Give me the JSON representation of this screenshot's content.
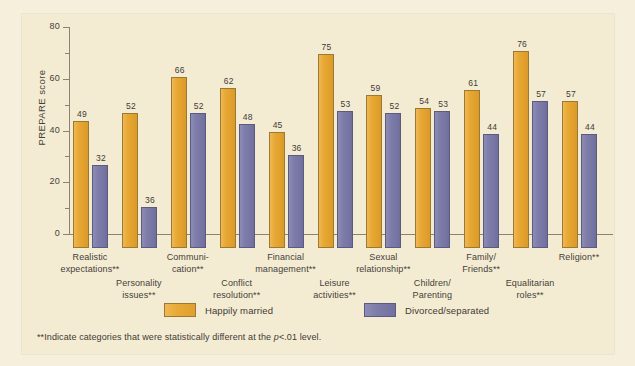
{
  "chart_data": {
    "type": "bar",
    "title": "",
    "xlabel": "",
    "ylabel": "PREPARE score",
    "ylim": [
      0,
      80
    ],
    "yticks": [
      0,
      20,
      40,
      60,
      80
    ],
    "ytick_labels": [
      "0",
      "20",
      "40",
      "60",
      "80"
    ],
    "minor_tick_interval": 10,
    "grid": false,
    "legend_position": "bottom-center",
    "categories": [
      "Realistic expectations**",
      "Personality issues**",
      "Communi- cation**",
      "Conflict resolution**",
      "Financial management**",
      "Leisure activities**",
      "Sexual relationship**",
      "Children/ Parenting",
      "Family/ Friends**",
      "Equalitarian roles**",
      "Religion**"
    ],
    "series": [
      {
        "name": "Happily married",
        "color": "#e8a936",
        "values": [
          49,
          52,
          66,
          62,
          45,
          75,
          59,
          54,
          61,
          76,
          57
        ]
      },
      {
        "name": "Divorced/separated",
        "color": "#7e7daa",
        "values": [
          32,
          36,
          52,
          48,
          36,
          53,
          52,
          53,
          44,
          57,
          44
        ],
        "drawn_values": [
          32,
          16,
          52,
          48,
          36,
          53,
          52,
          53,
          44,
          57,
          44
        ]
      }
    ],
    "annotations": [
      "**Indicate categories that were statistically different at the p<.01 level."
    ]
  },
  "axis": {
    "y_title": "PREPARE score",
    "y_ticks": [
      "80",
      "60",
      "40",
      "20",
      "0"
    ]
  },
  "x_labels": [
    {
      "lines": [
        "Realistic",
        "expectations**"
      ],
      "row": 0
    },
    {
      "lines": [
        "Personality",
        "issues**"
      ],
      "row": 1
    },
    {
      "lines": [
        "Communi-",
        "cation**"
      ],
      "row": 0
    },
    {
      "lines": [
        "Conflict",
        "resolution**"
      ],
      "row": 1
    },
    {
      "lines": [
        "Financial",
        "management**"
      ],
      "row": 0
    },
    {
      "lines": [
        "Leisure",
        "activities**"
      ],
      "row": 1
    },
    {
      "lines": [
        "Sexual",
        "relationship**"
      ],
      "row": 0
    },
    {
      "lines": [
        "Children/",
        "Parenting"
      ],
      "row": 1
    },
    {
      "lines": [
        "Family/",
        "Friends**"
      ],
      "row": 0
    },
    {
      "lines": [
        "Equalitarian",
        "roles**"
      ],
      "row": 1
    },
    {
      "lines": [
        "Religion**"
      ],
      "row": 0
    }
  ],
  "legend": {
    "items": [
      {
        "label": "Happily married",
        "color": "#e8a936"
      },
      {
        "label": "Divorced/separated",
        "color": "#7e7daa"
      }
    ]
  },
  "footnote": {
    "prefix": "**Indicate categories that were statistically different at the ",
    "italic": "p",
    "suffix": "<.01 level."
  },
  "colors": {
    "page_background": "#f6efdc",
    "panel_background": "#f4ecd2",
    "axis": "#8b8274",
    "text": "#45403a",
    "series_a": "#e8a936",
    "series_b": "#7e7daa"
  }
}
